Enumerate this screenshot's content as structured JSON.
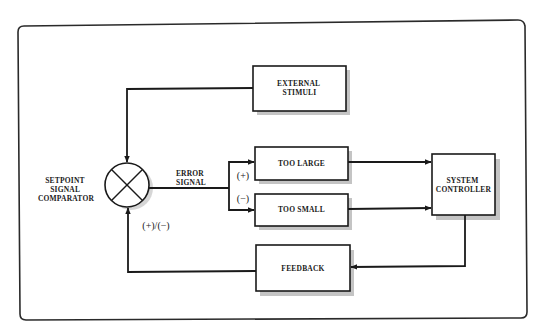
{
  "diagram": {
    "type": "block-diagram",
    "nodes": {
      "comparator": {
        "label_lines": [
          "SETPOINT",
          "SIGNAL",
          "COMPARATOR"
        ],
        "symbol": "summing-junction-x"
      },
      "external_stimuli": {
        "label_lines": [
          "EXTERNAL",
          "STIMULI"
        ]
      },
      "too_large": {
        "label": "TOO LARGE"
      },
      "too_small": {
        "label": "TOO SMALL"
      },
      "system_controller": {
        "label_lines": [
          "SYSTEM",
          "CONTROLLER"
        ]
      },
      "feedback": {
        "label": "FEEDBACK"
      }
    },
    "edge_labels": {
      "error_signal": [
        "ERROR",
        "SIGNAL"
      ],
      "plus": "(+)",
      "minus": "(−)",
      "plus_minus": "(+)/(−)"
    },
    "edges": [
      {
        "from": "external_stimuli",
        "to": "comparator"
      },
      {
        "from": "comparator",
        "to": "too_large",
        "label": "(+)"
      },
      {
        "from": "comparator",
        "to": "too_small",
        "label": "(−)"
      },
      {
        "from": "too_large",
        "to": "system_controller"
      },
      {
        "from": "too_small",
        "to": "system_controller"
      },
      {
        "from": "system_controller",
        "to": "feedback"
      },
      {
        "from": "feedback",
        "to": "comparator",
        "label": "(+)/(−)"
      }
    ],
    "colors": {
      "line": "#1a1a1a",
      "shadow": "#c4c4c4",
      "background": "#ffffff"
    }
  }
}
